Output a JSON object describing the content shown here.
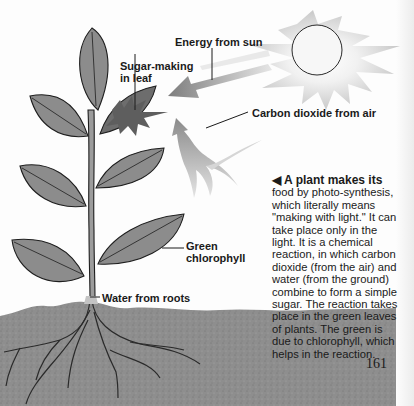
{
  "diagram": {
    "labels": {
      "energy": "Energy from sun",
      "sugar_line1": "Sugar-making",
      "sugar_line2": "in leaf",
      "co2": "Carbon dioxide from air",
      "green_line1": "Green",
      "green_line2": "chlorophyll",
      "water": "Water from roots"
    },
    "colors": {
      "leaf": "#8a8a8a",
      "leaf_outline": "#1e1e1e",
      "sun_rays": "#c8c8c8",
      "arrow": "#7a7a7a",
      "soil": "#8e8e8e",
      "text": "#1a1a1a"
    }
  },
  "caption": {
    "arrow": "◀",
    "lead": "A plant makes its",
    "body": "food by photo-synthesis, which literally means \"making with light.\" It can take place only in the light. It is a chemical reaction, in which carbon dioxide (from the air) and water (from the ground) combine to form a simple sugar. The reaction takes place in the green leaves of plants. The green is due to chlorophyll, which helps in the reaction."
  },
  "page_number": "161"
}
